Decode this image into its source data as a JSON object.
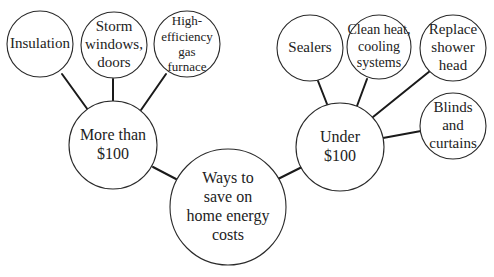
{
  "diagram": {
    "type": "concept-web",
    "colors": {
      "stroke": "#2a2a2a",
      "line": "#1a1a1a",
      "text": "#222222",
      "background": "#ffffff"
    },
    "root": {
      "id": "root",
      "label": "Ways to\nsave on\nhome energy\ncosts",
      "cx": 228,
      "cy": 207,
      "r": 58,
      "font_size": 16
    },
    "branches": [
      {
        "id": "more-than-100",
        "label": "More than\n$100",
        "cx": 113,
        "cy": 145,
        "r": 44,
        "font_size": 16,
        "link": {
          "x1": 153,
          "y1": 167,
          "x2": 176,
          "y2": 179
        },
        "children": [
          {
            "id": "insulation",
            "label": "Insulation",
            "cx": 40,
            "cy": 44,
            "r": 33,
            "font_size": 15,
            "link": {
              "x1": 62,
              "y1": 74,
              "x2": 88,
              "y2": 110
            }
          },
          {
            "id": "storm-windows-doors",
            "label": "Storm\nwindows,\ndoors",
            "cx": 114,
            "cy": 45,
            "r": 33,
            "font_size": 15,
            "link": {
              "x1": 113,
              "y1": 79,
              "x2": 113,
              "y2": 101
            }
          },
          {
            "id": "high-efficiency-gas-furnace",
            "label": "High-\nefficiency\ngas\nfurnace",
            "cx": 187,
            "cy": 44,
            "r": 33,
            "font_size": 13,
            "link": {
              "x1": 166,
              "y1": 74,
              "x2": 141,
              "y2": 110
            }
          }
        ]
      },
      {
        "id": "under-100",
        "label": "Under\n$100",
        "cx": 340,
        "cy": 147,
        "r": 44,
        "font_size": 16,
        "link": {
          "x1": 278,
          "y1": 179,
          "x2": 302,
          "y2": 167
        },
        "children": [
          {
            "id": "sealers",
            "label": "Sealers",
            "cx": 310,
            "cy": 48,
            "r": 33,
            "font_size": 15,
            "link": {
              "x1": 318,
              "y1": 81,
              "x2": 327,
              "y2": 104
            }
          },
          {
            "id": "clean-heat-cooling-systems",
            "label": "Clean heat,\ncooling\nsystems",
            "cx": 379,
            "cy": 47,
            "r": 32,
            "font_size": 14,
            "link": {
              "x1": 367,
              "y1": 79,
              "x2": 357,
              "y2": 106
            }
          },
          {
            "id": "replace-shower-head",
            "label": "Replace\nshower\nhead",
            "cx": 453,
            "cy": 48,
            "r": 33,
            "font_size": 15,
            "link": {
              "x1": 430,
              "y1": 71,
              "x2": 373,
              "y2": 117
            }
          },
          {
            "id": "blinds-and-curtains",
            "label": "Blinds\nand\ncurtains",
            "cx": 453,
            "cy": 126,
            "r": 33,
            "font_size": 15,
            "link": {
              "x1": 421,
              "y1": 131,
              "x2": 383,
              "y2": 138
            }
          }
        ]
      }
    ]
  }
}
